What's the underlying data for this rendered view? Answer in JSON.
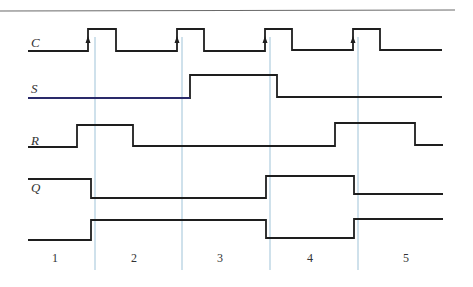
{
  "diagram": {
    "type": "timing-diagram",
    "colors": {
      "waveform": "#1e1e1e",
      "s_low_segment": "#2a2a6a",
      "guide_lines": "#9fc3d8",
      "top_rule": "#6a6a6a",
      "text": "#333333"
    },
    "signals": [
      {
        "name": "C",
        "label": "C",
        "label_pos": [
          31,
          47
        ],
        "points": [
          [
            28,
            51
          ],
          [
            88,
            51
          ],
          [
            88,
            29
          ],
          [
            116,
            29
          ],
          [
            116,
            51
          ],
          [
            177,
            51
          ],
          [
            177,
            29
          ],
          [
            204,
            29
          ],
          [
            204,
            51
          ],
          [
            265,
            51
          ],
          [
            265,
            29
          ],
          [
            292,
            29
          ],
          [
            292,
            50
          ],
          [
            353,
            50
          ],
          [
            353,
            29
          ],
          [
            380,
            29
          ],
          [
            380,
            50
          ],
          [
            442,
            50
          ]
        ],
        "arrows": [
          88,
          177,
          265,
          353
        ]
      },
      {
        "name": "S",
        "label": "S",
        "label_pos": [
          31,
          93
        ],
        "points": [
          [
            28,
            98
          ],
          [
            190,
            98
          ],
          [
            190,
            75
          ],
          [
            277,
            75
          ],
          [
            277,
            97
          ],
          [
            442,
            97
          ]
        ]
      },
      {
        "name": "R",
        "label": "R",
        "label_pos": [
          31,
          145
        ],
        "points": [
          [
            28,
            147
          ],
          [
            77,
            147
          ],
          [
            77,
            125
          ],
          [
            133,
            125
          ],
          [
            133,
            146
          ],
          [
            335,
            146
          ],
          [
            335,
            123
          ],
          [
            415,
            123
          ],
          [
            415,
            145
          ],
          [
            443,
            145
          ]
        ]
      },
      {
        "name": "Q",
        "label": "Q",
        "label_pos": [
          31,
          192
        ],
        "points": [
          [
            28,
            179
          ],
          [
            91,
            179
          ],
          [
            91,
            198
          ],
          [
            266,
            198
          ],
          [
            266,
            176
          ],
          [
            354,
            176
          ],
          [
            354,
            194
          ],
          [
            443,
            194
          ]
        ]
      },
      {
        "name": "Q_bar",
        "label": "",
        "points": [
          [
            28,
            240
          ],
          [
            91,
            240
          ],
          [
            91,
            220
          ],
          [
            266,
            220
          ],
          [
            266,
            238
          ],
          [
            354,
            238
          ],
          [
            354,
            219
          ],
          [
            443,
            219
          ]
        ]
      }
    ],
    "guide_lines_x": [
      95,
      182,
      270,
      358
    ],
    "guide_y_range": [
      37,
      270
    ],
    "periods": [
      {
        "label": "1",
        "x": 55
      },
      {
        "label": "2",
        "x": 134
      },
      {
        "label": "3",
        "x": 220
      },
      {
        "label": "4",
        "x": 310
      },
      {
        "label": "5",
        "x": 406
      }
    ],
    "period_label_y": 262
  }
}
